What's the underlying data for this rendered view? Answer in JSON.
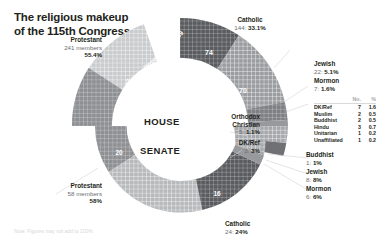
{
  "footnote": "Note: Figures may not add to 100%",
  "rings": {
    "house_label": "HOUSE",
    "senate_label": "SENATE"
  },
  "arc_labels": {
    "republicans": "Republicans: 159",
    "democrats": "Democrats: 82",
    "cath_rep": "74",
    "cath_dem": "70",
    "sen_prot_dem": "20",
    "sen_cath": "16"
  },
  "callouts": {
    "house_protestant": {
      "name": "Protestant",
      "members": "241 members",
      "pct": "55.4%"
    },
    "house_catholic": {
      "name": "Catholic",
      "value": "144",
      "pct": "33.1%"
    },
    "house_jewish": {
      "name": "Jewish",
      "value": "22",
      "pct": "5.1%"
    },
    "house_mormon": {
      "name": "Mormon",
      "value": "7",
      "pct": "1.6%"
    },
    "house_orthodox": {
      "name": "Orthodox",
      "name2": "Christian",
      "value": "5",
      "pct": "1.1%"
    },
    "senate_dkref": {
      "name": "DK/Ref",
      "value": "3",
      "pct": "3%"
    },
    "senate_buddhist": {
      "name": "Buddhist",
      "value": "1",
      "pct": "1%"
    },
    "senate_jewish": {
      "name": "Jewish",
      "value": "8",
      "pct": "8%"
    },
    "senate_mormon": {
      "name": "Mormon",
      "value": "6",
      "pct": "6%"
    },
    "senate_catholic": {
      "name": "Catholic",
      "value": "24",
      "pct": "24%"
    },
    "senate_protestant": {
      "name": "Protestant",
      "members": "58 members",
      "pct": "58%"
    }
  },
  "minor_table": {
    "headers": [
      "",
      "No.",
      "%"
    ],
    "rows": [
      {
        "name": "DK/Ref",
        "no": "7",
        "pct": "1.6"
      },
      {
        "name": "Muslim",
        "no": "2",
        "pct": "0.5"
      },
      {
        "name": "Buddhist",
        "no": "2",
        "pct": "0.5"
      },
      {
        "name": "Hindu",
        "no": "3",
        "pct": "0.7"
      },
      {
        "name": "Unitarian",
        "no": "1",
        "pct": "0.2"
      },
      {
        "name": "Unaffiliated",
        "no": "1",
        "pct": "0.2"
      }
    ]
  },
  "chart_data": {
    "type": "pie",
    "note": "Two concentric donut rings: outer = HOUSE, inner = SENATE",
    "legend_position": "callouts",
    "series": [
      {
        "name": "HOUSE",
        "total": 435,
        "unit": "members",
        "slices": [
          {
            "label": "Protestant",
            "value": 241,
            "pct": 55.4,
            "color": "#b7b9bb",
            "sub": [
              {
                "label": "Republicans",
                "value": 159,
                "color": "#c9cbcd"
              },
              {
                "label": "Democrats",
                "value": 82,
                "color": "#8e9093"
              }
            ]
          },
          {
            "label": "Catholic",
            "value": 144,
            "pct": 33.1,
            "color": "#6a6c6f",
            "sub": [
              {
                "label": "Republicans",
                "value": 74,
                "color": "#5a5c5f"
              },
              {
                "label": "Democrats",
                "value": 70,
                "color": "#9a9c9f"
              }
            ]
          },
          {
            "label": "Jewish",
            "value": 22,
            "pct": 5.1,
            "color": "#7e8083"
          },
          {
            "label": "Mormon",
            "value": 7,
            "pct": 1.6,
            "color": "#97999c"
          },
          {
            "label": "DK/Ref",
            "value": 7,
            "pct": 1.6,
            "color": "#a6a8ab"
          },
          {
            "label": "Orthodox Christian",
            "value": 5,
            "pct": 1.1,
            "color": "#6f7174"
          },
          {
            "label": "Hindu",
            "value": 3,
            "pct": 0.7,
            "color": "#8a8c8f"
          },
          {
            "label": "Muslim",
            "value": 2,
            "pct": 0.5,
            "color": "#949699"
          },
          {
            "label": "Buddhist",
            "value": 2,
            "pct": 0.5,
            "color": "#9ea0a3"
          },
          {
            "label": "Unitarian",
            "value": 1,
            "pct": 0.2,
            "color": "#aaacaf"
          },
          {
            "label": "Unaffiliated",
            "value": 1,
            "pct": 0.2,
            "color": "#b2b4b7"
          }
        ]
      },
      {
        "name": "SENATE",
        "total": 100,
        "unit": "members",
        "slices": [
          {
            "label": "Protestant",
            "value": 58,
            "pct": 58,
            "color": "#b7b9bb",
            "sub": [
              {
                "label": "Republicans",
                "value": 38,
                "color": "#c9cbcd"
              },
              {
                "label": "Democrats",
                "value": 20,
                "color": "#8e9093"
              }
            ]
          },
          {
            "label": "Catholic",
            "value": 24,
            "pct": 24,
            "color": "#6a6c6f",
            "sub": [
              {
                "label": "Democrats",
                "value": 16,
                "color": "#5a5c5f"
              },
              {
                "label": "Republicans",
                "value": 8,
                "color": "#9a9c9f"
              }
            ]
          },
          {
            "label": "Jewish",
            "value": 8,
            "pct": 8,
            "color": "#7e8083"
          },
          {
            "label": "Mormon",
            "value": 6,
            "pct": 6,
            "color": "#97999c"
          },
          {
            "label": "DK/Ref",
            "value": 3,
            "pct": 3,
            "color": "#a6a8ab"
          },
          {
            "label": "Buddhist",
            "value": 1,
            "pct": 1,
            "color": "#9ea0a3"
          }
        ]
      }
    ]
  }
}
